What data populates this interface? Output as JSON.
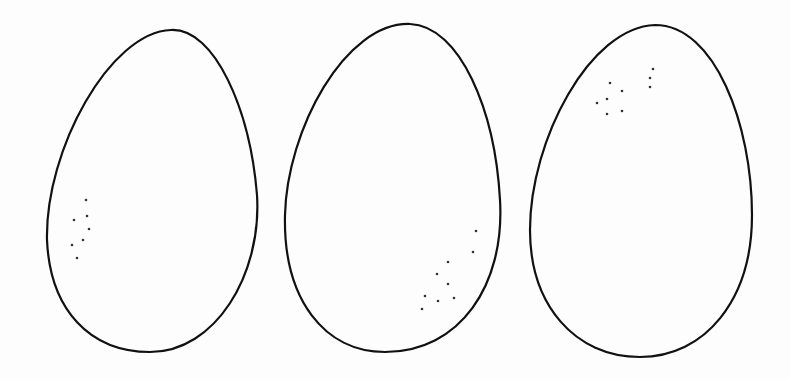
{
  "image": {
    "width": 790,
    "height": 379,
    "background": "#fdfdfd",
    "stroke_color": "#111111"
  },
  "eggs": [
    {
      "name": "egg-1",
      "path": "M171,30 C215,28 250,110 257,195 C262,275 215,352 150,352 C90,352 50,310 47,240 C45,150 110,32 171,30 Z",
      "dots": [
        [
          86,
          200
        ],
        [
          87,
          216
        ],
        [
          74,
          220
        ],
        [
          89,
          229
        ],
        [
          83,
          240
        ],
        [
          72,
          245
        ],
        [
          77,
          258
        ]
      ]
    },
    {
      "name": "egg-2",
      "path": "M410,24 C460,26 495,110 500,200 C505,285 460,352 385,352 C325,352 283,300 285,215 C287,130 345,22 410,24 Z",
      "dots": [
        [
          476,
          231
        ],
        [
          473,
          252
        ],
        [
          448,
          262
        ],
        [
          437,
          274
        ],
        [
          448,
          284
        ],
        [
          425,
          296
        ],
        [
          438,
          301
        ],
        [
          454,
          298
        ],
        [
          422,
          309
        ]
      ]
    },
    {
      "name": "egg-3",
      "path": "M655,25 C715,25 752,125 752,215 C752,300 705,357 640,357 C575,357 530,305 530,230 C530,140 590,27 655,25 Z",
      "dots": [
        [
          653,
          69
        ],
        [
          650,
          78
        ],
        [
          650,
          87
        ],
        [
          610,
          83
        ],
        [
          622,
          91
        ],
        [
          607,
          99
        ],
        [
          597,
          103
        ],
        [
          607,
          114
        ],
        [
          622,
          111
        ]
      ]
    }
  ]
}
